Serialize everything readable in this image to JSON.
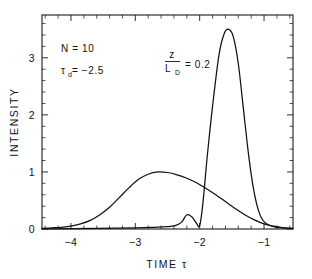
{
  "chart_data": {
    "type": "line",
    "title": "",
    "xlabel": "TIME τ",
    "ylabel": "INTENSITY",
    "xlim": [
      -4.45,
      -0.55
    ],
    "ylim": [
      0,
      3.75
    ],
    "grid": false,
    "legend": "none",
    "x_ticks": [
      -4,
      -3,
      -2,
      -1
    ],
    "x_tick_labels": [
      "−4",
      "−3",
      "−2",
      "−1"
    ],
    "x_minor_step": 0.2,
    "y_ticks": [
      0,
      1,
      2,
      3
    ],
    "y_tick_labels": [
      "0",
      "1",
      "2",
      "3"
    ],
    "y_minor_step": 0.2,
    "series": [
      {
        "name": "input pulse",
        "x": [
          -4.45,
          -4.3,
          -4.15,
          -4.0,
          -3.85,
          -3.7,
          -3.55,
          -3.4,
          -3.25,
          -3.1,
          -2.95,
          -2.8,
          -2.65,
          -2.5,
          -2.35,
          -2.2,
          -2.05,
          -1.9,
          -1.75,
          -1.6,
          -1.45,
          -1.3,
          -1.15,
          -1.0,
          -0.85,
          -0.7,
          -0.55
        ],
        "y": [
          0.01,
          0.02,
          0.03,
          0.05,
          0.09,
          0.15,
          0.25,
          0.38,
          0.55,
          0.72,
          0.87,
          0.96,
          1.0,
          0.99,
          0.95,
          0.89,
          0.81,
          0.71,
          0.6,
          0.48,
          0.36,
          0.25,
          0.16,
          0.09,
          0.05,
          0.02,
          0.01
        ]
      },
      {
        "name": "compressed pulse",
        "x": [
          -4.45,
          -3.6,
          -3.0,
          -2.7,
          -2.5,
          -2.38,
          -2.28,
          -2.2,
          -2.12,
          -2.05,
          -2.0,
          -1.95,
          -1.88,
          -1.8,
          -1.7,
          -1.62,
          -1.55,
          -1.48,
          -1.4,
          -1.32,
          -1.24,
          -1.16,
          -1.08,
          -1.0,
          -0.85,
          -0.7,
          -0.55
        ],
        "y": [
          0.0,
          0.01,
          0.02,
          0.03,
          0.04,
          0.06,
          0.12,
          0.25,
          0.21,
          0.1,
          0.06,
          0.45,
          1.3,
          2.15,
          3.05,
          3.42,
          3.5,
          3.38,
          2.9,
          2.1,
          1.3,
          0.68,
          0.3,
          0.13,
          0.04,
          0.02,
          0.01
        ]
      }
    ],
    "annotations": [
      {
        "id": "n-value",
        "text": "N = 10",
        "x": -3.9,
        "y": 3.1
      },
      {
        "id": "tau-d-value",
        "symbol": "τ",
        "subscript": "d",
        "text": " = −2.5",
        "x": -3.9,
        "y": 2.72
      },
      {
        "id": "z-over-ld-value",
        "numerator": "z",
        "denominator": "L",
        "denominator_sub": "D",
        "text": "= 0.2",
        "x": -2.35,
        "y": 2.9
      }
    ]
  }
}
